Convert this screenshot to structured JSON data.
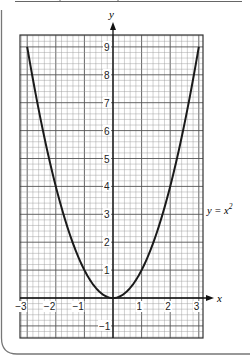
{
  "chart_data": {
    "type": "line",
    "title": "",
    "function_label": "y = x",
    "function_label_exponent": "2",
    "xlabel": "x",
    "ylabel": "y",
    "xlim": [
      -3.25,
      3.15
    ],
    "ylim": [
      -1.45,
      9.4
    ],
    "x_ticks": [
      -3,
      -2,
      -1,
      1,
      2,
      3
    ],
    "x_tick_labels": [
      "−3",
      "−2",
      "−1",
      "1",
      "2",
      "3"
    ],
    "y_ticks": [
      -1,
      1,
      2,
      3,
      4,
      5,
      6,
      7,
      8,
      9
    ],
    "y_tick_labels": [
      "−1",
      "1",
      "2",
      "3",
      "4",
      "5",
      "6",
      "7",
      "8",
      "9"
    ],
    "grid": true,
    "minor_divisions_per_unit": 5,
    "series": [
      {
        "name": "y = x^2",
        "x": [
          -3,
          -2.5,
          -2,
          -1.5,
          -1,
          -0.5,
          0,
          0.5,
          1,
          1.5,
          2,
          2.5,
          3
        ],
        "values": [
          9,
          6.25,
          4,
          2.25,
          1,
          0.25,
          0,
          0.25,
          1,
          2.25,
          4,
          6.25,
          9
        ]
      }
    ]
  },
  "colors": {
    "curve": "#1a1a1a",
    "major_grid": "#555555",
    "minor_grid": "#9a9a9a",
    "frame": "#777777"
  }
}
